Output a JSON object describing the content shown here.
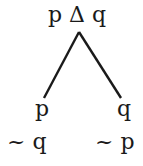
{
  "root": {
    "label": "p Δ q"
  },
  "left_branch": {
    "line1": "p",
    "line2": "~ q"
  },
  "right_branch": {
    "line1": "q",
    "line2": "~ p"
  },
  "colors": {
    "ink": "#1a1a1a",
    "background": "#ffffff"
  }
}
